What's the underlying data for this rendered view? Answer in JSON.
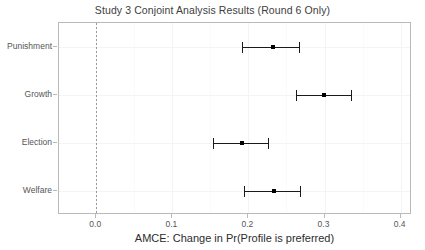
{
  "chart_data": {
    "type": "scatter",
    "title": "Study 3 Conjoint Analysis Results (Round 6 Only)",
    "xlabel": "AMCE: Change in Pr(Profile is preferred)",
    "ylabel": "",
    "xlim": [
      -0.049,
      0.415
    ],
    "xticks": [
      0.0,
      0.1,
      0.2,
      0.3,
      0.4
    ],
    "xtick_labels": [
      "0.0",
      "0.1",
      "0.2",
      "0.3",
      "0.4"
    ],
    "categories": [
      "Punishment",
      "Growth",
      "Election",
      "Welfare"
    ],
    "values": [
      0.232,
      0.299,
      0.191,
      0.233
    ],
    "ci_low": [
      0.191,
      0.263,
      0.154,
      0.194
    ],
    "ci_high": [
      0.267,
      0.335,
      0.226,
      0.268
    ],
    "reference_line": 0.0,
    "reference_line_style": "dotted",
    "grid": true,
    "legend": "none",
    "point_color": "#000000",
    "errorbar_color": "#1a1a1a",
    "panel_border_color": "#b9b9b9",
    "points": [
      {
        "label": "Punishment",
        "estimate": 0.232,
        "lower": 0.191,
        "upper": 0.267
      },
      {
        "label": "Growth",
        "estimate": 0.299,
        "lower": 0.263,
        "upper": 0.335
      },
      {
        "label": "Election",
        "estimate": 0.191,
        "lower": 0.154,
        "upper": 0.226
      },
      {
        "label": "Welfare",
        "estimate": 0.233,
        "lower": 0.194,
        "upper": 0.268
      }
    ]
  }
}
